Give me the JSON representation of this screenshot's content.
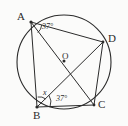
{
  "figure": {
    "background_color": "#fbfbfa",
    "stroke_color": "#2b2b2b",
    "type": "geometry-diagram"
  },
  "circle": {
    "name": "circumcircle",
    "center": {
      "x": 64,
      "y": 62
    },
    "radius": 47
  },
  "center_point": {
    "label": "O",
    "x": 64,
    "y": 61,
    "label_x": 62,
    "label_y": 53
  },
  "vertices": [
    {
      "id": "A",
      "label": "A",
      "x": 31,
      "y": 22,
      "label_x": 18,
      "label_y": 13
    },
    {
      "id": "D",
      "label": "D",
      "x": 103,
      "y": 42,
      "label_x": 108,
      "label_y": 34
    },
    {
      "id": "C",
      "label": "C",
      "x": 94,
      "y": 105,
      "label_x": 98,
      "label_y": 100
    },
    {
      "id": "B",
      "label": "B",
      "x": 37,
      "y": 107,
      "label_x": 33,
      "label_y": 110
    }
  ],
  "chords": [
    {
      "from": "A",
      "to": "D",
      "name": "chord-ad"
    },
    {
      "from": "A",
      "to": "B",
      "name": "chord-ab"
    },
    {
      "from": "A",
      "to": "C",
      "name": "diagonal-ac"
    },
    {
      "from": "B",
      "to": "D",
      "name": "diagonal-bd"
    },
    {
      "from": "B",
      "to": "C",
      "name": "chord-bc"
    },
    {
      "from": "D",
      "to": "C",
      "name": "chord-dc"
    }
  ],
  "angles": [
    {
      "id": "angle-at-a",
      "label": "37°",
      "value": 37,
      "unit": "degrees",
      "vertex": "A",
      "between": [
        "AD",
        "AC"
      ],
      "label_x": 42,
      "label_y": 25
    },
    {
      "id": "angle-at-b",
      "label": "37°",
      "value": 37,
      "unit": "degrees",
      "vertex": "B",
      "between": [
        "BD",
        "BC"
      ],
      "label_x": 56,
      "label_y": 96
    },
    {
      "id": "angle-x",
      "label": "x",
      "value": null,
      "unit": "unknown",
      "vertex": "B",
      "between": [
        "BA",
        "BD"
      ],
      "label_x": 43,
      "label_y": 92
    }
  ],
  "angle_arcs": [
    {
      "id": "arc-a",
      "vertex": "A",
      "radius": 10
    },
    {
      "id": "arc-b-37",
      "vertex": "B",
      "radius": 12
    },
    {
      "id": "arc-b-x",
      "vertex": "B",
      "radius": 9
    }
  ]
}
